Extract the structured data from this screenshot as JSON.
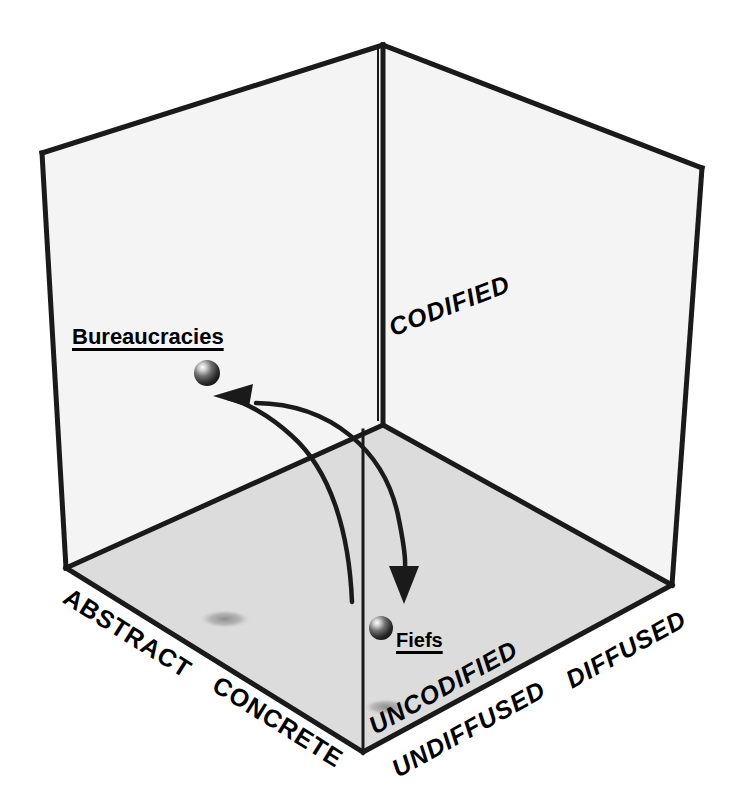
{
  "figure": {
    "background_color": "#ffffff",
    "line_color": "#1a1a1a",
    "floor_fill": "#d9d9d9",
    "wall_fill": "#f2f2f2",
    "shadow_color": "#9a9a9a"
  },
  "axes": [
    {
      "id": "abstract",
      "label": "ABSTRACT",
      "style": "upright-diagonal",
      "edge": "front-left-bottom"
    },
    {
      "id": "concrete",
      "label": "CONCRETE",
      "style": "upright-diagonal",
      "edge": "front-left-bottom"
    },
    {
      "id": "codified",
      "label": "CODIFIED",
      "style": "italic",
      "edge": "back-right-top"
    },
    {
      "id": "uncodified",
      "label": "UNCODIFIED",
      "style": "italic",
      "edge": "floor-right-inner"
    },
    {
      "id": "undiffused",
      "label": "UNDIFFUSED",
      "style": "italic",
      "edge": "front-right-bottom"
    },
    {
      "id": "diffused",
      "label": "DIFFUSED",
      "style": "italic",
      "edge": "front-right-bottom"
    }
  ],
  "points": [
    {
      "id": "bureaucracies",
      "label": "Bureaucracies",
      "sphere_x": 207,
      "sphere_y": 373,
      "shadow_x": 225,
      "shadow_y": 619
    },
    {
      "id": "fiefs",
      "label": "Fiefs",
      "sphere_x": 381,
      "sphere_y": 628,
      "shadow_x": 386,
      "shadow_y": 707
    }
  ],
  "arrows": [
    {
      "id": "bureaucracies-to-fiefs",
      "from": "bureaucracies",
      "to": "fiefs",
      "direction": "down",
      "description": "curve descending from the Bureaucracies region to the Fiefs point"
    },
    {
      "id": "fiefs-to-bureaucracies",
      "from": "fiefs",
      "to": "bureaucracies",
      "direction": "up-left",
      "description": "curve ascending from the Fiefs region to the Bureaucracies point"
    }
  ]
}
